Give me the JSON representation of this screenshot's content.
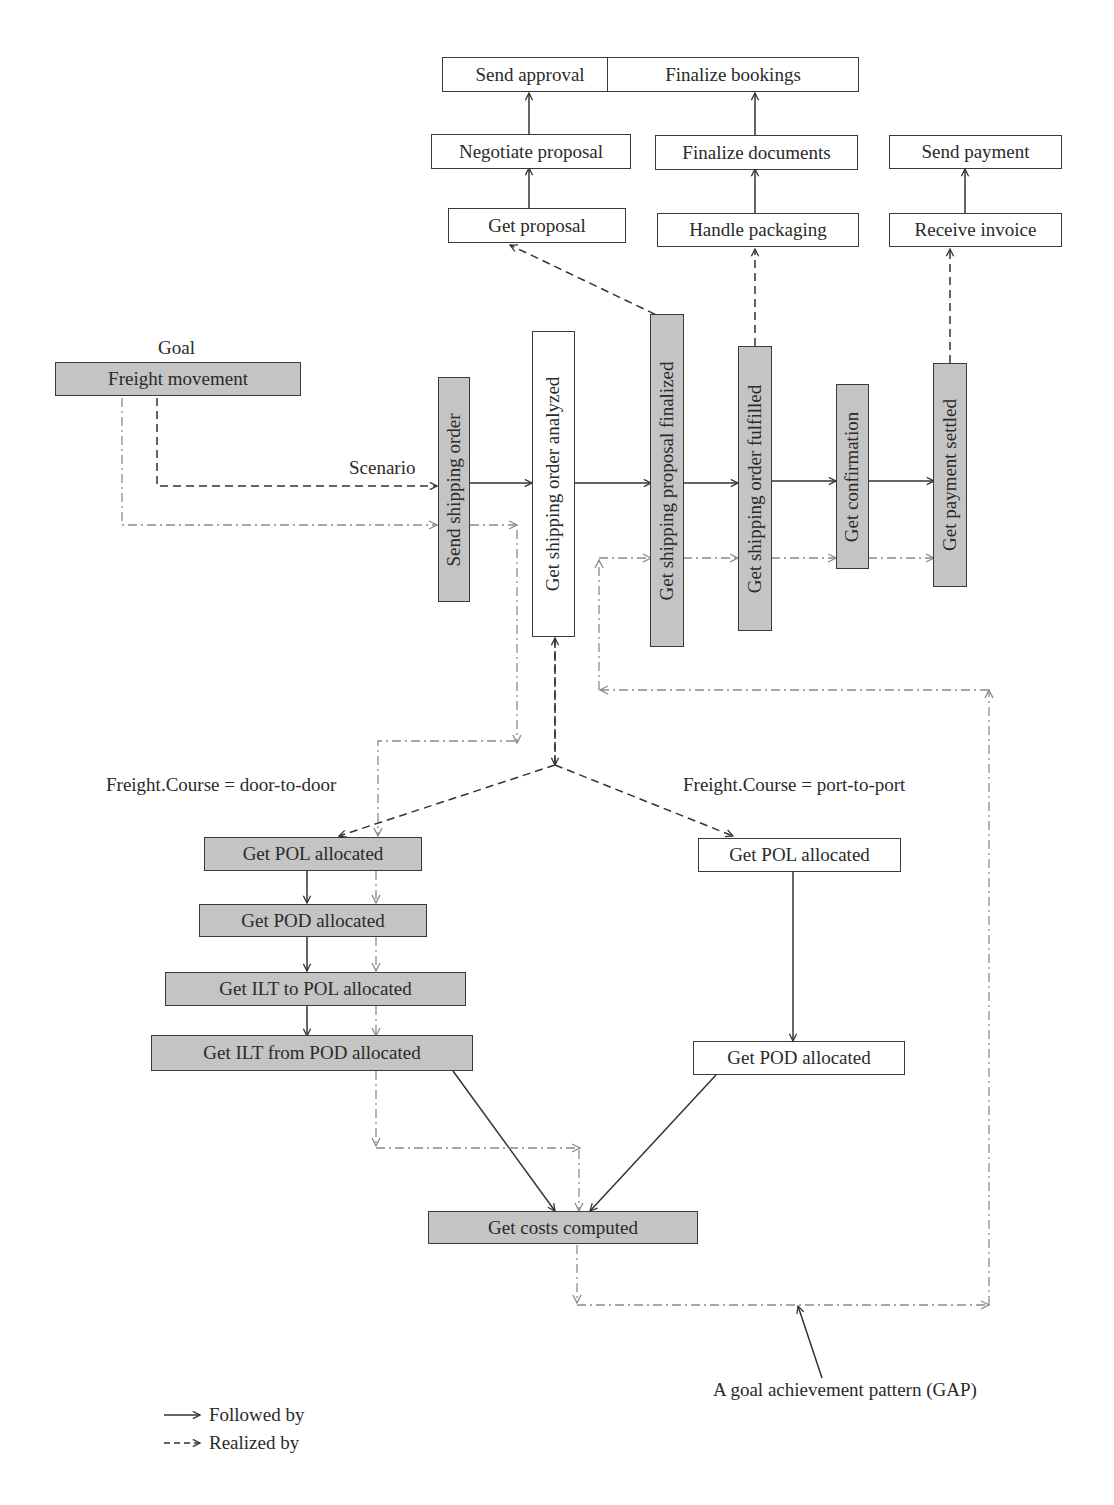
{
  "goal": {
    "label": "Goal",
    "name": "Freight movement"
  },
  "scenario_label": "Scenario",
  "main_sequence": [
    {
      "id": "send_shipping_order",
      "label": "Send shipping order",
      "fill": "gray"
    },
    {
      "id": "get_shipping_order_analyzed",
      "label": "Get shipping order analyzed",
      "fill": "white"
    },
    {
      "id": "get_shipping_proposal_finalized",
      "label": "Get shipping proposal finalized",
      "fill": "gray"
    },
    {
      "id": "get_shipping_order_fulfilled",
      "label": "Get shipping order fulfilled",
      "fill": "gray"
    },
    {
      "id": "get_confirmation",
      "label": "Get confirmation",
      "fill": "gray"
    },
    {
      "id": "get_payment_settled",
      "label": "Get payment settled",
      "fill": "gray"
    }
  ],
  "proposal_subgoals": [
    "Get proposal",
    "Negotiate proposal",
    "Send approval"
  ],
  "fulfillment_subgoals": [
    "Handle packaging",
    "Finalize documents",
    "Finalize bookings"
  ],
  "payment_subgoals": [
    "Receive invoice",
    "Send payment"
  ],
  "branches": {
    "door_to_door": {
      "condition": "Freight.Course = door-to-door",
      "steps": [
        "Get POL allocated",
        "Get POD allocated",
        "Get ILT to POL allocated",
        "Get ILT from POD allocated"
      ]
    },
    "port_to_port": {
      "condition": "Freight.Course = port-to-port",
      "steps": [
        "Get POL allocated",
        "Get POD allocated"
      ]
    }
  },
  "merge_step": "Get costs computed",
  "gap_annotation": "A goal achievement pattern (GAP)",
  "legend": [
    {
      "symbol": "solid-arrow",
      "label": "Followed by"
    },
    {
      "symbol": "dashed-arrow",
      "label": "Realized by"
    }
  ],
  "colors": {
    "gray_fill": "#c4c4c4",
    "stroke": "#3a3a3a",
    "gap_stroke": "#8a8a8a"
  }
}
